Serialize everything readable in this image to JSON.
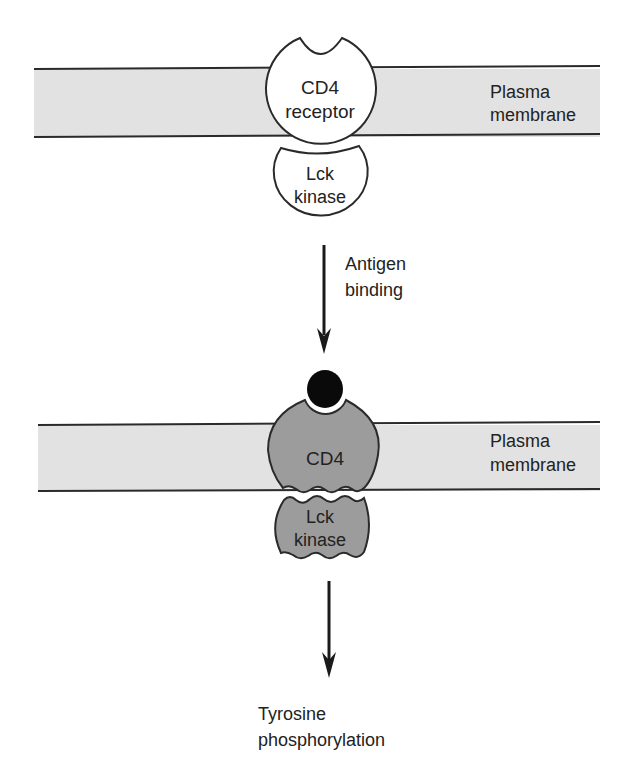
{
  "diagram": {
    "colors": {
      "membrane_fill": "#e2e2e2",
      "membrane_line": "#2a2a2a",
      "resting_protein_fill": "#ffffff",
      "active_protein_fill": "#9c9c9c",
      "ligand_fill": "#0a0a0a",
      "ink": "#222222"
    },
    "top_state": {
      "membrane_label_line1": "Plasma",
      "membrane_label_line2": "membrane",
      "receptor_label_line1": "CD4",
      "receptor_label_line2": "receptor",
      "kinase_label_line1": "Lck",
      "kinase_label_line2": "kinase"
    },
    "transition": {
      "label_line1": "Antigen",
      "label_line2": "binding"
    },
    "bottom_state": {
      "membrane_label_line1": "Plasma",
      "membrane_label_line2": "membrane",
      "receptor_label": "CD4",
      "kinase_label_line1": "Lck",
      "kinase_label_line2": "kinase",
      "ligand": "antigen"
    },
    "outcome": {
      "label_line1": "Tyrosine",
      "label_line2": "phosphorylation"
    }
  }
}
